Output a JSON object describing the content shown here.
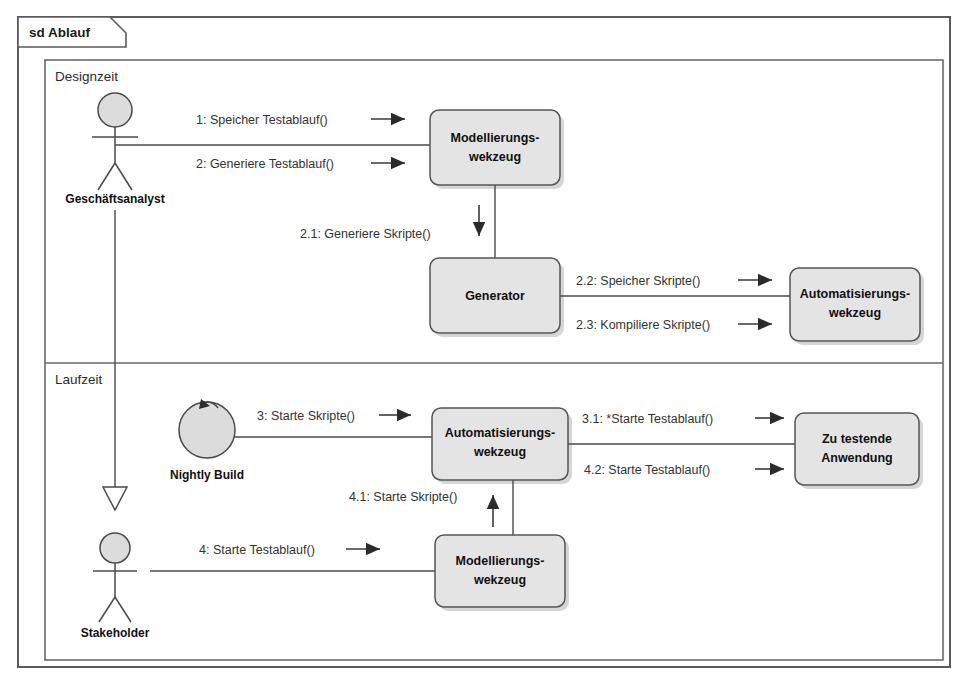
{
  "frame": {
    "tab_label": "sd Ablauf",
    "regions": [
      {
        "id": "designzeit",
        "label": "Designzeit"
      },
      {
        "id": "laufzeit",
        "label": "Laufzeit"
      }
    ]
  },
  "actors": [
    {
      "id": "geschaeftsanalyst",
      "name": "Geschäftsanalyst",
      "type": "stick-figure"
    },
    {
      "id": "nightly-build",
      "name": "Nightly Build",
      "type": "timer-circle"
    },
    {
      "id": "stakeholder",
      "name": "Stakeholder",
      "type": "stick-figure"
    }
  ],
  "nodes": [
    {
      "id": "modellierungswerkzeug-design",
      "line1": "Modellierungs-",
      "line2": "wekzeug"
    },
    {
      "id": "generator",
      "line1": "Generator",
      "line2": ""
    },
    {
      "id": "automatisierungswerkzeug-design",
      "line1": "Automatisierungs-",
      "line2": "wekzeug"
    },
    {
      "id": "automatisierungswerkzeug-laufzeit",
      "line1": "Automatisierungs-",
      "line2": "wekzeug"
    },
    {
      "id": "zu-testende-anwendung",
      "line1": "Zu testende",
      "line2": "Anwendung"
    },
    {
      "id": "modellierungswerkzeug-laufzeit",
      "line1": "Modellierungs-",
      "line2": "wekzeug"
    }
  ],
  "messages": [
    {
      "id": "m1",
      "label": "1: Speicher Testablauf()"
    },
    {
      "id": "m2",
      "label": "2: Generiere Testablauf()"
    },
    {
      "id": "m21",
      "label": "2.1: Generiere Skripte()"
    },
    {
      "id": "m22",
      "label": "2.2: Speicher Skripte()"
    },
    {
      "id": "m23",
      "label": "2.3: Kompiliere Skripte()"
    },
    {
      "id": "m3",
      "label": "3: Starte Skripte()"
    },
    {
      "id": "m31",
      "label": "3.1: *Starte Testablauf()"
    },
    {
      "id": "m4",
      "label": "4: Starte Testablauf()"
    },
    {
      "id": "m41",
      "label": "4.1: Starte Skripte()"
    },
    {
      "id": "m42",
      "label": "4.2: Starte Testablauf()"
    }
  ],
  "colors": {
    "node_fill": "#e4e4e4",
    "node_stroke": "#555555",
    "frame_stroke": "#5b5b5b",
    "line": "#4a4a4a",
    "text": "#111111",
    "background": "#ffffff"
  }
}
